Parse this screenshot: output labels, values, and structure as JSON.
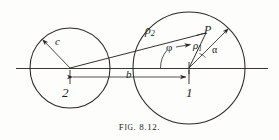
{
  "figure": {
    "caption_prefix": "F",
    "caption_smallcaps": "IG",
    "caption_number": ". 8.12.",
    "caption_full": "FIG. 8.12."
  },
  "labels": {
    "radius_c": "c",
    "rho2": "ρ",
    "rho2_sub": "2",
    "point_p": "P",
    "rho1": "ρ",
    "rho1_sub": "1",
    "alpha": "α",
    "phi": "φ",
    "distance_b": "b",
    "circle_two": "2",
    "circle_one": "1"
  },
  "colors": {
    "ink": "#201d1c",
    "line": "#2a2724",
    "background": "#fdfdfc"
  },
  "geometry": {
    "circle_two": {
      "cx": 70,
      "cy": 68,
      "r": 40
    },
    "circle_one": {
      "cx": 189,
      "cy": 68,
      "r": 56
    },
    "point_p": {
      "x": 206,
      "y": 33
    },
    "axis": {
      "x1": 16,
      "y": 68,
      "x2": 268
    },
    "dimension_b": {
      "x1": 70,
      "x2": 189,
      "y": 77
    }
  }
}
